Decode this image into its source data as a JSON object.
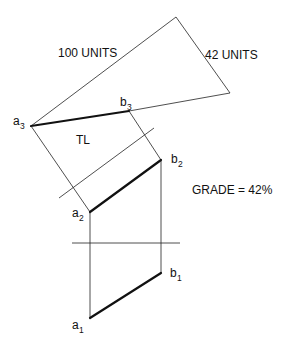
{
  "diagram": {
    "labels": {
      "hyp": "100 UNITS",
      "rise": "42 UNITS",
      "tl": "TL",
      "grade": "GRADE = 42%"
    },
    "points": {
      "a3": {
        "base": "a",
        "sub": "3"
      },
      "b3": {
        "base": "b",
        "sub": "3"
      },
      "a2": {
        "base": "a",
        "sub": "2"
      },
      "b2": {
        "base": "b",
        "sub": "2"
      },
      "a1": {
        "base": "a",
        "sub": "1"
      },
      "b1": {
        "base": "b",
        "sub": "1"
      }
    },
    "colors": {
      "line": "#111111",
      "background": "#ffffff"
    }
  }
}
